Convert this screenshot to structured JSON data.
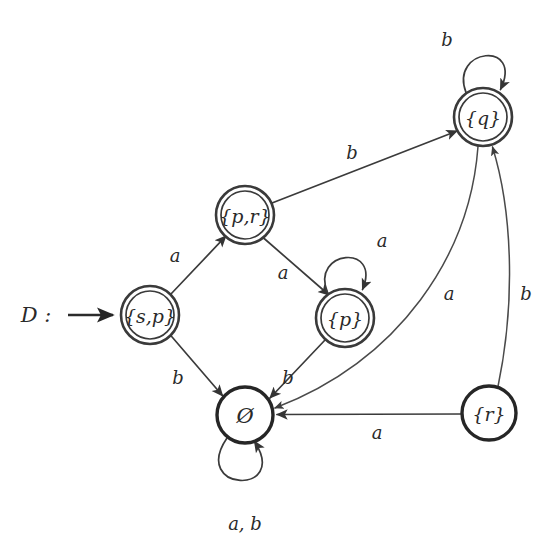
{
  "diagram": {
    "kind": "finite-automaton-state-diagram",
    "title": "",
    "start_marker": {
      "label": "D :",
      "x": 36,
      "y": 315,
      "arrow_from_x": 68,
      "arrow_to_x": 117,
      "arrow_y": 315
    },
    "ink_color": "#3a3a3a",
    "background_color": "#ffffff",
    "nodes": [
      {
        "id": "sp",
        "label": "{s,p}",
        "x": 150,
        "y": 315,
        "r": 29,
        "accepting": true,
        "start": true
      },
      {
        "id": "pr",
        "label": "{p,r}",
        "x": 245,
        "y": 215,
        "r": 29,
        "accepting": true,
        "start": false
      },
      {
        "id": "p",
        "label": "{p}",
        "x": 345,
        "y": 318,
        "r": 29,
        "accepting": true,
        "start": false
      },
      {
        "id": "q",
        "label": "{q}",
        "x": 483,
        "y": 117,
        "r": 29,
        "accepting": true,
        "start": false
      },
      {
        "id": "empty",
        "label": "Ø",
        "x": 245,
        "y": 415,
        "r": 28,
        "accepting": false,
        "start": false
      },
      {
        "id": "r",
        "label": "{r}",
        "x": 489,
        "y": 413,
        "r": 27,
        "accepting": false,
        "start": false
      }
    ],
    "edges": [
      {
        "id": "sp-pr",
        "from": "sp",
        "to": "pr",
        "label": "a",
        "label_x": 175,
        "label_y": 255,
        "kind": "straight"
      },
      {
        "id": "sp-empty",
        "from": "sp",
        "to": "empty",
        "label": "b",
        "label_x": 178,
        "label_y": 377,
        "kind": "straight"
      },
      {
        "id": "pr-p",
        "from": "pr",
        "to": "p",
        "label": "a",
        "label_x": 283,
        "label_y": 272,
        "kind": "straight"
      },
      {
        "id": "pr-q",
        "from": "pr",
        "to": "q",
        "label": "b",
        "label_x": 352,
        "label_y": 152,
        "kind": "straight"
      },
      {
        "id": "p-p",
        "from": "p",
        "to": "p",
        "label": "a",
        "label_x": 382,
        "label_y": 240,
        "kind": "self-loop-top"
      },
      {
        "id": "p-empty",
        "from": "p",
        "to": "empty",
        "label": "b",
        "label_x": 288,
        "label_y": 377,
        "kind": "straight"
      },
      {
        "id": "q-q",
        "from": "q",
        "to": "q",
        "label": "b",
        "label_x": 447,
        "label_y": 39,
        "kind": "self-loop-top"
      },
      {
        "id": "q-empty",
        "from": "q",
        "to": "empty",
        "label": "a",
        "label_x": 449,
        "label_y": 293,
        "kind": "curve"
      },
      {
        "id": "r-empty",
        "from": "r",
        "to": "empty",
        "label": "a",
        "label_x": 377,
        "label_y": 432,
        "kind": "straight"
      },
      {
        "id": "r-q",
        "from": "r",
        "to": "q",
        "label": "b",
        "label_x": 526,
        "label_y": 293,
        "kind": "curve"
      },
      {
        "id": "empty-empty",
        "from": "empty",
        "to": "empty",
        "label": "a, b",
        "label_x": 245,
        "label_y": 523,
        "kind": "self-loop-bottom"
      }
    ]
  }
}
